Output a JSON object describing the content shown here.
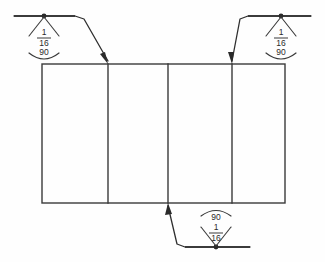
{
  "drawing": {
    "type": "welding-symbol-diagram",
    "background_color": "#fefefe",
    "line_color": "#3a3a3a",
    "plate": {
      "label": "plate-outline",
      "panel_count": 4
    },
    "annotations": [
      {
        "id": "weld-symbol-top-left",
        "position": "top-left",
        "orientation": "arrow-side-below",
        "size": "1",
        "size_denominator": "16",
        "size_fraction": "1/16",
        "length": "90",
        "arc_side": "below"
      },
      {
        "id": "weld-symbol-top-right",
        "position": "top-right",
        "orientation": "arrow-side-below",
        "size": "1",
        "size_denominator": "16",
        "size_fraction": "1/16",
        "length": "90",
        "arc_side": "below"
      },
      {
        "id": "weld-symbol-bottom",
        "position": "bottom-center",
        "orientation": "other-side-above",
        "size": "1",
        "size_denominator": "16",
        "size_fraction": "1/16",
        "length": "90",
        "arc_side": "above"
      }
    ]
  }
}
